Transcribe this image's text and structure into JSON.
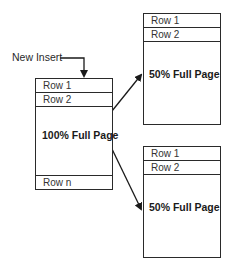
{
  "diagram": {
    "insert_label": "New Insert",
    "source_page": {
      "rows": [
        "Row 1",
        "Row 2"
      ],
      "fill_label": "100% Full Page",
      "last_row": "Row n"
    },
    "split_pages": [
      {
        "rows": [
          "Row 1",
          "Row 2"
        ],
        "fill_label": "50% Full Page"
      },
      {
        "rows": [
          "Row 1",
          "Row 2"
        ],
        "fill_label": "50% Full Page"
      }
    ],
    "colors": {
      "line": "#2a2a2a",
      "background": "#ffffff"
    }
  }
}
